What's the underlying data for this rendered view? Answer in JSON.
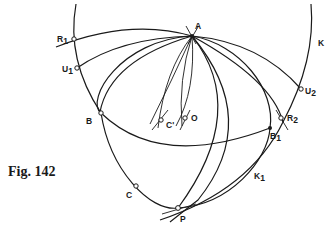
{
  "figure": {
    "caption": "Fig. 142",
    "colors": {
      "ink": "#1a1a1a",
      "background": "#ffffff"
    },
    "points": {
      "A": {
        "label": "A",
        "x": 192,
        "y": 36
      },
      "R1": {
        "label": "R",
        "sub": "1",
        "x": 74,
        "y": 39
      },
      "U1": {
        "label": "U",
        "sub": "1",
        "x": 77,
        "y": 68
      },
      "U2": {
        "label": "U",
        "sub": "2",
        "x": 301,
        "y": 89
      },
      "R2": {
        "label": "R",
        "sub": "2",
        "x": 281,
        "y": 118
      },
      "B1": {
        "label": "B",
        "sub": "1",
        "x": 270,
        "y": 128
      },
      "B": {
        "label": "B",
        "x": 101,
        "y": 113
      },
      "C": {
        "label": "C",
        "x": 136,
        "y": 186
      },
      "P": {
        "label": "P",
        "x": 178,
        "y": 208
      },
      "C_prime": {
        "label": "C'",
        "x": 161,
        "y": 120
      },
      "O": {
        "label": "O",
        "x": 185,
        "y": 118
      }
    },
    "curve_labels": {
      "K": "K",
      "K1": {
        "label": "K",
        "sub": "1"
      }
    }
  }
}
